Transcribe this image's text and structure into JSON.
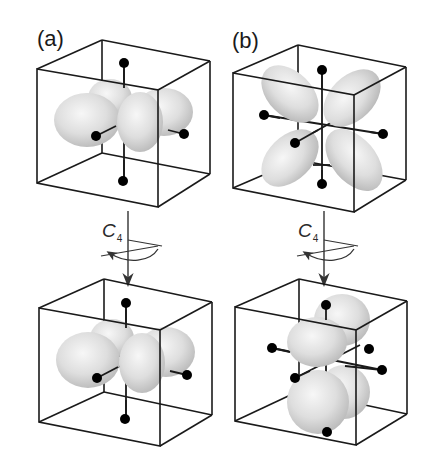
{
  "figure": {
    "panels": [
      {
        "label": "(a)",
        "description": "d-orbital lobes lying along x and y axes (dx2-y2-like) inside octahedral ligand cube",
        "before_rotation": "axis-aligned four-lobe orbital",
        "after_rotation": "axis-aligned four-lobe orbital (unchanged under C4)"
      },
      {
        "label": "(b)",
        "description": "d-orbital lobes lying between axes (dxz-like) inside octahedral ligand cube",
        "before_rotation": "diagonal four-lobe orbital in xz plane",
        "after_rotation": "four-lobe orbital rotated into yz plane"
      }
    ],
    "operation": {
      "symbol": "C",
      "subscript": "4",
      "meaning": "four-fold rotation about vertical axis"
    },
    "colors": {
      "line": "#1a1a1a",
      "ligand": "#000000",
      "lobe_light": "#f4f4f4",
      "lobe_dark": "#b9b9b9",
      "background": "#ffffff"
    }
  }
}
